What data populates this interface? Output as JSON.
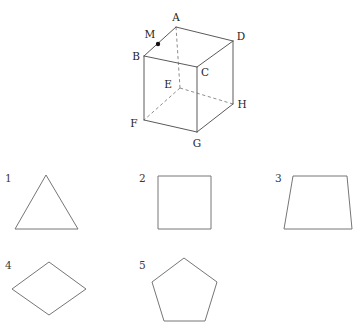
{
  "canvas": {
    "width": 362,
    "height": 335,
    "background": "#ffffff"
  },
  "style": {
    "edge_color": "#5a5a5a",
    "hidden_edge_color": "#8e8e8e",
    "shape_outline_color": "#767676",
    "label_color": "#242424",
    "point_color": "#111111"
  },
  "cube": {
    "name": "labelled-cube-diagram",
    "vertices": {
      "A": {
        "label": "A",
        "x": 176,
        "y": 27,
        "label_x": 176,
        "label_y": 21,
        "hidden": false
      },
      "B": {
        "label": "B",
        "x": 144,
        "y": 56,
        "label_x": 136,
        "label_y": 60,
        "hidden": false
      },
      "C": {
        "label": "C",
        "x": 197,
        "y": 67,
        "label_x": 205,
        "label_y": 76,
        "hidden": false
      },
      "D": {
        "label": "D",
        "x": 233,
        "y": 41,
        "label_x": 241,
        "label_y": 40,
        "hidden": false
      },
      "E": {
        "label": "E",
        "x": 180,
        "y": 88,
        "label_x": 168,
        "label_y": 88,
        "hidden": true
      },
      "F": {
        "label": "F",
        "x": 144,
        "y": 120,
        "label_x": 134,
        "label_y": 127,
        "hidden": false
      },
      "G": {
        "label": "G",
        "x": 197,
        "y": 132,
        "label_x": 197,
        "label_y": 147,
        "hidden": false
      },
      "H": {
        "label": "H",
        "x": 233,
        "y": 104,
        "label_x": 242,
        "label_y": 108,
        "hidden": false
      }
    },
    "marked_point": {
      "label": "M",
      "x": 158,
      "y": 44,
      "label_x": 150,
      "label_y": 38,
      "description": "midpoint-marker-on-edge-AB"
    },
    "visible_edges": [
      [
        "A",
        "B"
      ],
      [
        "A",
        "D"
      ],
      [
        "B",
        "C"
      ],
      [
        "C",
        "D"
      ],
      [
        "B",
        "F"
      ],
      [
        "C",
        "G"
      ],
      [
        "D",
        "H"
      ],
      [
        "F",
        "G"
      ],
      [
        "G",
        "H"
      ]
    ],
    "hidden_edges": [
      [
        "A",
        "E"
      ],
      [
        "E",
        "F"
      ],
      [
        "E",
        "H"
      ]
    ]
  },
  "shapes": [
    {
      "number": "1",
      "name": "triangle",
      "label_x": 5,
      "label_y": 182,
      "points": "46,175 78,229 15,229"
    },
    {
      "number": "2",
      "name": "square",
      "label_x": 139,
      "label_y": 182,
      "points": "158,176 211,176 211,229 158,229"
    },
    {
      "number": "3",
      "name": "trapezoid",
      "label_x": 275,
      "label_y": 182,
      "points": "293,176 347,176 352,229 284,229"
    },
    {
      "number": "4",
      "name": "rhombus",
      "label_x": 5,
      "label_y": 269,
      "points": "49,262 86,289 49,315 12,289"
    },
    {
      "number": "5",
      "name": "pentagon",
      "label_x": 139,
      "label_y": 269,
      "points": "184,258 217,282 205,321 164,321 152,282"
    }
  ]
}
